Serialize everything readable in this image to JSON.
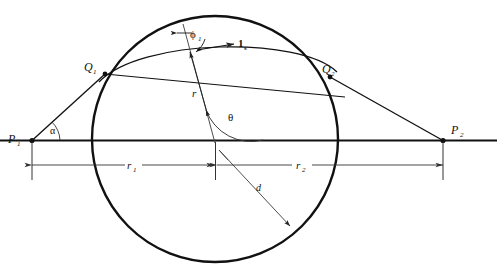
{
  "figure": {
    "kind": "geometry-diagram",
    "stroke_color": "#111111",
    "thin_stroke_color": "#333333",
    "background": "#ffffff"
  },
  "labels": {
    "p1": {
      "base": "P",
      "sub": "1"
    },
    "p2": {
      "base": "P",
      "sub": "2"
    },
    "q1": {
      "base": "Q",
      "sub": "1"
    },
    "q2": {
      "base": "Q",
      "sub": "2"
    },
    "alpha": {
      "base": "α",
      "sub": ""
    },
    "theta": {
      "base": "θ",
      "sub": ""
    },
    "phi1": {
      "base": "ϕ",
      "sub": "1"
    },
    "unit_vector_s": {
      "base": "1",
      "sub": "s"
    },
    "radius_r": {
      "base": "r",
      "sub": ""
    },
    "distance_d": {
      "base": "d",
      "sub": ""
    },
    "dim_r1": {
      "base": "r",
      "sub": "1"
    },
    "dim_r2": {
      "base": "r",
      "sub": "2"
    }
  },
  "geometry": {
    "baseline": {
      "y": 140,
      "x_start": 0,
      "x_end": 497
    },
    "circle": {
      "cx": 215,
      "cy": 139,
      "r": 123
    },
    "points": {
      "p1": {
        "x": 32,
        "y": 140
      },
      "p2": {
        "x": 443,
        "y": 140
      },
      "q1": {
        "x": 105,
        "y": 74
      },
      "q2": {
        "x": 330,
        "y": 77
      }
    },
    "dimension_line": {
      "y": 165,
      "ticks": [
        32,
        215,
        443
      ]
    }
  }
}
